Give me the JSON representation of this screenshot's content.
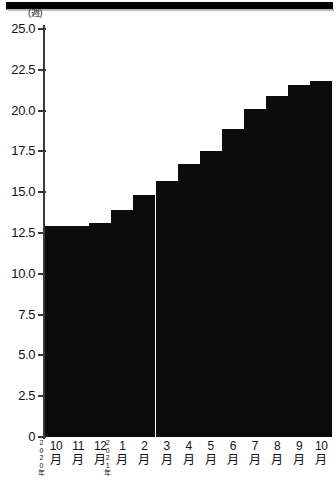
{
  "chart_data": {
    "type": "bar",
    "title": "",
    "subtitle": "",
    "xlabel": "",
    "ylabel": "(週)",
    "unit_label": "(週)",
    "ylim": [
      0,
      25.0
    ],
    "grid": false,
    "legend": null,
    "yticks": [
      "25.0",
      "22.5",
      "20.0",
      "17.5",
      "15.0",
      "12.5",
      "10.0",
      "7.5",
      "5.0",
      "2.5",
      "0"
    ],
    "ytick_values": [
      25.0,
      22.5,
      20.0,
      17.5,
      15.0,
      12.5,
      10.0,
      7.5,
      5.0,
      2.5,
      0
    ],
    "categories": [
      "10月",
      "11月",
      "12月",
      "1月",
      "2月",
      "3月",
      "4月",
      "5月",
      "6月",
      "7月",
      "8月",
      "9月",
      "10月"
    ],
    "category_numbers": [
      "10",
      "11",
      "12",
      "1",
      "2",
      "3",
      "4",
      "5",
      "6",
      "7",
      "8",
      "9",
      "10"
    ],
    "category_suffix": "月",
    "values": [
      12.9,
      12.9,
      13.1,
      13.9,
      14.8,
      15.7,
      16.7,
      17.5,
      18.9,
      20.1,
      20.9,
      21.6,
      21.8
    ],
    "year_markers": [
      {
        "index": 0,
        "lines": [
          "2",
          "0",
          "2",
          "0",
          "年"
        ]
      },
      {
        "index": 3,
        "lines": [
          "2",
          "0",
          "2",
          "1",
          "年"
        ]
      }
    ],
    "bar_color": "#0b0b0b",
    "axis_color": "#3a3a3a",
    "background_color": "#ffffff"
  }
}
